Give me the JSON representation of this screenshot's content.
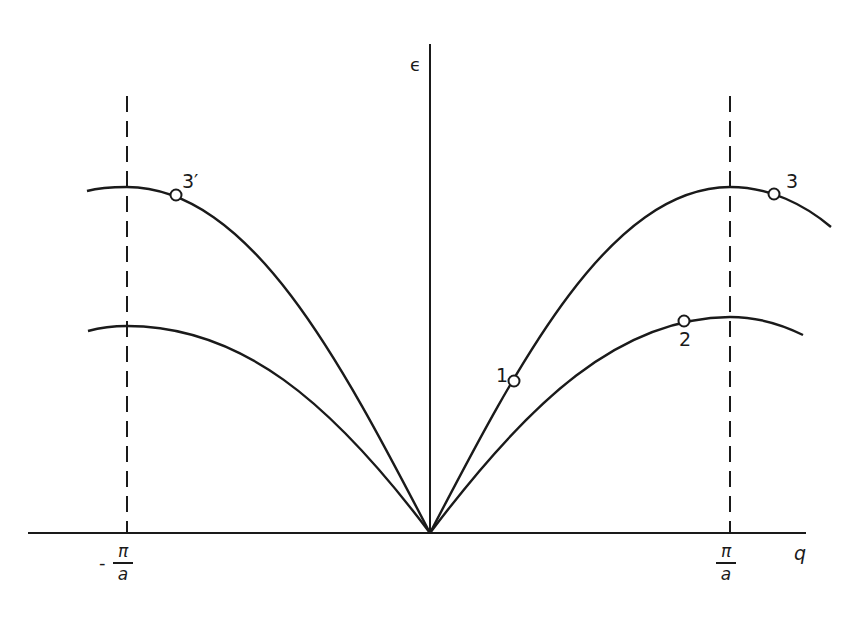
{
  "figure": {
    "type": "dispersion-diagram",
    "axes": {
      "y_label": "ϵ",
      "x_label": "q",
      "left_boundary": {
        "sign": "-",
        "numerator": "π",
        "denominator": "a"
      },
      "right_boundary": {
        "sign": "",
        "numerator": "π",
        "denominator": "a"
      }
    },
    "branches": [
      {
        "name": "upper-branch",
        "description": "optical-like upper curve, peaks at ±π/a"
      },
      {
        "name": "lower-branch",
        "description": "acoustic-like lower curve, peaks at ±π/a"
      }
    ],
    "points": [
      {
        "label": "1",
        "branch": "upper-branch",
        "side": "right"
      },
      {
        "label": "2",
        "branch": "lower-branch",
        "side": "right"
      },
      {
        "label": "3",
        "branch": "upper-branch",
        "side": "right"
      },
      {
        "label": "3′",
        "branch": "upper-branch",
        "side": "left"
      }
    ],
    "colors": {
      "ink": "#1a1a1a",
      "background": "#ffffff"
    }
  }
}
